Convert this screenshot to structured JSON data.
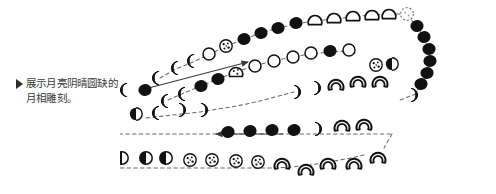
{
  "figure": {
    "background_color": "#ffffff",
    "ink_color": "#111111",
    "line_color": "#555555"
  },
  "caption": {
    "bullet_icon": "triangle-right-icon",
    "line1": "展示月亮阴晴圆缺的",
    "line2": "月相雕刻。",
    "text": "展示月亮阴晴圆缺的\n月相雕刻。",
    "font_size_px": 10.5,
    "color": "#3a3a3a"
  },
  "illustration": {
    "description": "hand-drawn serpentine sequence of carved moon-phase glyphs connected by dashed leader lines, with two solid direction arrows",
    "arrows": [
      {
        "name": "arrow-up-right",
        "from_x": 141,
        "from_y": 90,
        "to_x": 250,
        "to_y": 62
      },
      {
        "name": "arrow-left",
        "from_x": 283,
        "from_y": 134,
        "to_x": 215,
        "to_y": 134
      }
    ],
    "rows": [
      {
        "name": "row-1-top-outer",
        "direction": "left-to-right",
        "phases": [
          "waning-crescent",
          "waning-crescent",
          "new",
          "new",
          "gibbous-outline",
          "new",
          "new",
          "new",
          "new",
          "new",
          "waning-gibbous-outline",
          "waxing-gibbous-outline",
          "waxing-gibbous-outline",
          "waxing-gibbous-outline",
          "full-dotted"
        ]
      },
      {
        "name": "row-2-inner-return",
        "direction": "left-to-right",
        "phases": [
          "waning-crescent",
          "waning-crescent",
          "new",
          "new",
          "gibbous-dotted",
          "full-outline",
          "full-outline",
          "full-outline",
          "full-outline",
          "new",
          "full-outline"
        ]
      },
      {
        "name": "row-3-right-turn",
        "direction": "top-to-bottom",
        "phases": [
          "new",
          "new",
          "new",
          "new",
          "new",
          "new",
          "waxing-crescent"
        ]
      },
      {
        "name": "row-4-middle",
        "direction": "left-to-right",
        "phases": [
          "waning-crescent",
          "new",
          "waning-crescent",
          "gibbous-dotted",
          "half-dark",
          "waxing-crescent",
          "waxing-crescent",
          "waxing-crescent",
          "waxing-crescent"
        ]
      },
      {
        "name": "row-5-lower-middle",
        "direction": "right-to-left",
        "phases": [
          "full-dotted",
          "full-dotted",
          "gibbous-outline",
          "gibbous-outline",
          "half-dark",
          "half-dark",
          "waning-crescent",
          "waxing-crescent",
          "waxing-crescent",
          "new",
          "new",
          "new",
          "new",
          "waxing-crescent",
          "waxing-crescent",
          "waxing-crescent"
        ]
      },
      {
        "name": "row-6-bottom",
        "direction": "left-to-right",
        "phases": [
          "new",
          "new",
          "new",
          "new",
          "half-split",
          "half-split",
          "half-split",
          "full-dotted",
          "full-dotted",
          "full-dotted",
          "full-dotted",
          "crescent-open",
          "crescent-open",
          "crescent-open",
          "crescent-open",
          "crescent-open"
        ]
      }
    ]
  }
}
